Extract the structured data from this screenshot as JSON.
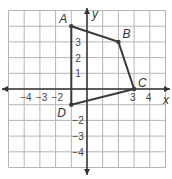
{
  "diagram": {
    "type": "coordinate-plane-polygon",
    "x_range": [
      -5,
      5
    ],
    "y_range": [
      -5,
      5
    ],
    "axis_labels": {
      "x": "x",
      "y": "y"
    },
    "x_tick_labels": [
      "−4",
      "−3",
      "−2",
      "3",
      "4"
    ],
    "y_tick_labels": [
      "3",
      "2",
      "1",
      "−2",
      "−3",
      "−4"
    ],
    "vertices": [
      {
        "name": "A",
        "x": -1,
        "y": 4
      },
      {
        "name": "B",
        "x": 2,
        "y": 3
      },
      {
        "name": "C",
        "x": 3,
        "y": 0
      },
      {
        "name": "D",
        "x": -1,
        "y": -1
      }
    ],
    "stroke_color": "#3a3a3a",
    "grid_color": "#b5b5b5"
  }
}
